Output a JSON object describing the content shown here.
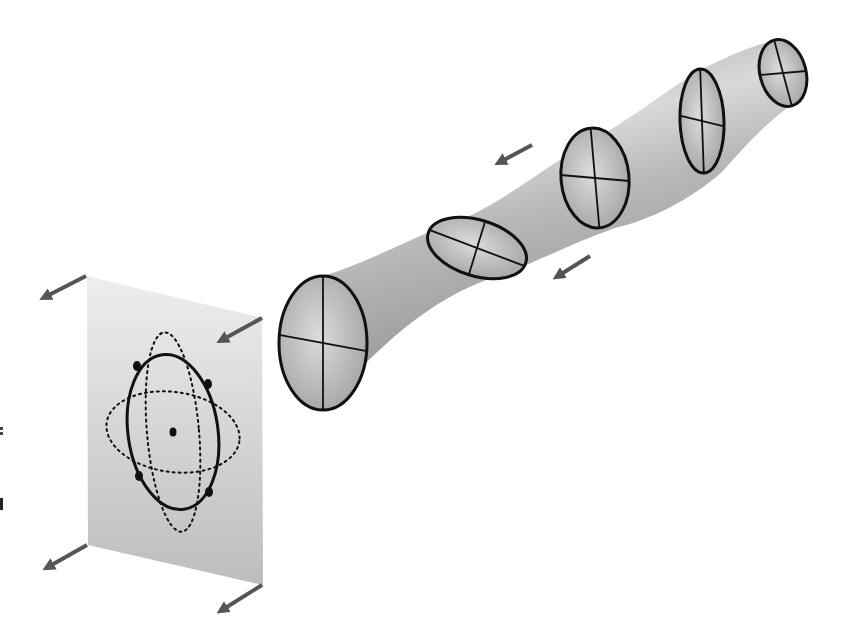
{
  "figure": {
    "colors": {
      "background": "#ffffff",
      "tube_light": "#e2e2e2",
      "tube_mid": "#b4b4b4",
      "tube_dark": "#8a8a8a",
      "plate_light": "#ececec",
      "plate_dark": "#b8b8b8",
      "outline": "#111111",
      "arrow": "#555555"
    },
    "tube": {
      "cross_sections": [
        {
          "id": "section-1",
          "cx": 323,
          "cy": 343,
          "rx": 44,
          "ry": 67,
          "rot": 0
        },
        {
          "id": "section-2",
          "cx": 477,
          "cy": 248,
          "rx": 51,
          "ry": 28,
          "rot": 17
        },
        {
          "id": "section-3",
          "cx": 595,
          "cy": 178,
          "rx": 34,
          "ry": 50,
          "rot": -5
        },
        {
          "id": "section-4",
          "cx": 702,
          "cy": 121,
          "rx": 22,
          "ry": 52,
          "rot": -2
        },
        {
          "id": "section-5",
          "cx": 783,
          "cy": 73,
          "rx": 23,
          "ry": 34,
          "rot": -15
        }
      ],
      "propagation_arrows": [
        {
          "id": "arrow-tube-upper",
          "x1": 532,
          "y1": 145,
          "x2": 500,
          "y2": 162
        },
        {
          "id": "arrow-tube-lower",
          "x1": 590,
          "y1": 256,
          "x2": 558,
          "y2": 276
        }
      ]
    },
    "plate": {
      "corners": [
        [
          87,
          276
        ],
        [
          262,
          318
        ],
        [
          263,
          585
        ],
        [
          88,
          545
        ]
      ],
      "center": [
        173,
        432
      ],
      "solid_ring": {
        "rx": 45,
        "ry": 78,
        "rot": -8
      },
      "dotted_vertical": {
        "rx": 26,
        "ry": 100,
        "rot": -5
      },
      "dotted_horizontal": {
        "rx": 67,
        "ry": 40,
        "rot": 8
      },
      "particles": [
        [
          137,
          366
        ],
        [
          208,
          384
        ],
        [
          139,
          476
        ],
        [
          209,
          492
        ]
      ],
      "corner_arrows": [
        {
          "id": "arrow-plate-top-left",
          "x1": 86,
          "y1": 276,
          "x2": 45,
          "y2": 297
        },
        {
          "id": "arrow-plate-top-right",
          "x1": 262,
          "y1": 318,
          "x2": 222,
          "y2": 340
        },
        {
          "id": "arrow-plate-bottom-left",
          "x1": 87,
          "y1": 545,
          "x2": 48,
          "y2": 567
        },
        {
          "id": "arrow-plate-bottom-right",
          "x1": 262,
          "y1": 585,
          "x2": 222,
          "y2": 610
        }
      ]
    }
  }
}
